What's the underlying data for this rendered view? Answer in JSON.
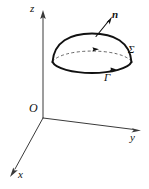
{
  "figure": {
    "kind": "3d-coordinate-diagram",
    "background_color": "#ffffff",
    "stroke_color": "#111111",
    "axis_color": "#3a3a3a",
    "width": 149,
    "height": 189
  },
  "axes": {
    "z": {
      "label": "z",
      "origin": [
        43,
        118
      ],
      "tip": [
        43,
        13
      ]
    },
    "y": {
      "label": "y",
      "origin": [
        43,
        118
      ],
      "tip": [
        139,
        130
      ]
    },
    "x": {
      "label": "x",
      "origin": [
        43,
        118
      ],
      "tip": [
        11,
        173
      ]
    },
    "origin_label": "O"
  },
  "surface": {
    "label": "Σ",
    "label_meaning": "Sigma",
    "center": [
      92,
      62
    ],
    "base_rx": 40,
    "base_ry": 13,
    "apex": [
      92,
      33
    ]
  },
  "boundary": {
    "label": "Γ",
    "label_meaning": "Gamma",
    "orientation": "counterclockwise-from-above",
    "arrow_on_curve": true
  },
  "normal": {
    "label": "n",
    "label_meaning": "unit normal vector",
    "tail": [
      96,
      36
    ],
    "tip": [
      111,
      18
    ],
    "bold": true
  },
  "hidden_arc": {
    "style": "dashed",
    "meaning": "back half of base circle seen through surface",
    "arrow_direction": "right"
  }
}
